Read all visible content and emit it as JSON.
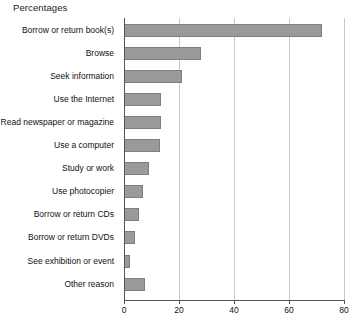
{
  "chart_data": {
    "type": "bar",
    "orientation": "horizontal",
    "title": "Percentages",
    "xlabel": "",
    "ylabel": "",
    "xlim": [
      0,
      80
    ],
    "xticks": [
      0,
      20,
      40,
      60,
      80
    ],
    "grid": true,
    "legend": "none",
    "bar_color": "#9a9a9a",
    "bar_border_color": "#7e7e7e",
    "grid_color": "#c8c8c8",
    "axis_color": "#555555",
    "categories": [
      "Borrow or return book(s)",
      "Browse",
      "Seek information",
      "Use the Internet",
      "Read newspaper or magazine",
      "Use a computer",
      "Study or work",
      "Use photocopier",
      "Borrow or return CDs",
      "Borrow or return DVDs",
      "See exhibition or event",
      "Other reason"
    ],
    "values": [
      72,
      28,
      21,
      13.5,
      13.5,
      13,
      9,
      7,
      5.5,
      4,
      2,
      7.5
    ]
  }
}
